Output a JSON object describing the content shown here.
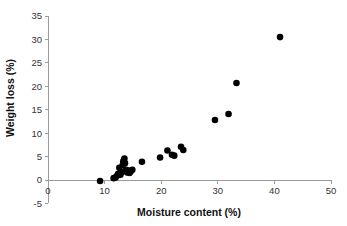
{
  "chart_data": {
    "type": "scatter",
    "title": "",
    "xlabel": "Moisture content (%)",
    "ylabel": "Weight loss (%)",
    "xlim": [
      0,
      50
    ],
    "ylim": [
      -5,
      35
    ],
    "xticks": [
      0,
      10,
      20,
      30,
      40,
      50
    ],
    "yticks": [
      -5,
      0,
      5,
      10,
      15,
      20,
      25,
      30,
      35
    ],
    "xtick_labels": [
      "0",
      "10",
      "20",
      "30",
      "40",
      "50"
    ],
    "ytick_labels": [
      "-5",
      "0",
      "5",
      "10",
      "15",
      "20",
      "25",
      "30",
      "35"
    ],
    "grid": false,
    "legend": null,
    "marker": {
      "shape": "circle",
      "color": "#000000",
      "size": 4.2
    },
    "series": [
      {
        "name": "samples",
        "points": [
          {
            "x": 9.2,
            "y": -0.2
          },
          {
            "x": 11.6,
            "y": 0.4
          },
          {
            "x": 11.9,
            "y": 0.5
          },
          {
            "x": 12.2,
            "y": 0.9
          },
          {
            "x": 12.4,
            "y": 1.3
          },
          {
            "x": 12.6,
            "y": 2.6
          },
          {
            "x": 12.8,
            "y": 1.1
          },
          {
            "x": 13.0,
            "y": 1.7
          },
          {
            "x": 13.2,
            "y": 3.2
          },
          {
            "x": 13.3,
            "y": 4.0
          },
          {
            "x": 13.5,
            "y": 4.6
          },
          {
            "x": 13.6,
            "y": 3.6
          },
          {
            "x": 13.8,
            "y": 2.2
          },
          {
            "x": 14.0,
            "y": 1.6
          },
          {
            "x": 14.2,
            "y": 2.0
          },
          {
            "x": 14.4,
            "y": 1.5
          },
          {
            "x": 14.6,
            "y": 1.8
          },
          {
            "x": 14.9,
            "y": 2.2
          },
          {
            "x": 16.6,
            "y": 3.9
          },
          {
            "x": 19.8,
            "y": 4.8
          },
          {
            "x": 21.1,
            "y": 6.3
          },
          {
            "x": 21.9,
            "y": 5.4
          },
          {
            "x": 22.3,
            "y": 5.2
          },
          {
            "x": 23.5,
            "y": 7.1
          },
          {
            "x": 23.9,
            "y": 6.4
          },
          {
            "x": 29.5,
            "y": 12.8
          },
          {
            "x": 31.9,
            "y": 14.1
          },
          {
            "x": 33.3,
            "y": 20.7
          },
          {
            "x": 41.0,
            "y": 30.5
          }
        ]
      }
    ]
  }
}
